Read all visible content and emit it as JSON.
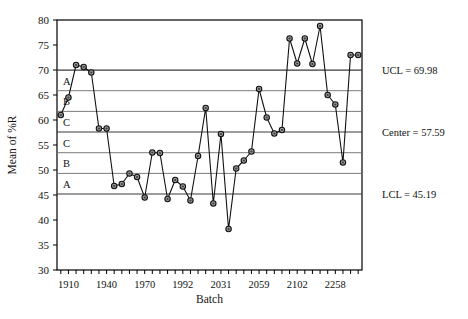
{
  "chart_data": {
    "type": "line",
    "title": "",
    "subtitle": "",
    "xlabel": "Batch",
    "ylabel": "Mean of %R",
    "xlim": [
      0,
      40
    ],
    "ylim": [
      30,
      80
    ],
    "grid": true,
    "legend_position": "none",
    "ytick_labels": [
      "30",
      "35",
      "40",
      "45",
      "50",
      "55",
      "60",
      "65",
      "70",
      "75",
      "80"
    ],
    "ytick_values": [
      30,
      35,
      40,
      45,
      50,
      55,
      60,
      65,
      70,
      75,
      80
    ],
    "xtick_labels": [
      "1910",
      "1940",
      "1970",
      "1992",
      "2031",
      "2059",
      "2102",
      "2258"
    ],
    "xtick_indices": [
      1,
      6,
      11,
      16,
      21,
      26,
      31,
      36
    ],
    "n_minor_ticks": 40,
    "x": [
      1,
      2,
      3,
      4,
      5,
      6,
      7,
      8,
      9,
      10,
      11,
      12,
      13,
      14,
      15,
      16,
      17,
      18,
      19,
      20,
      21,
      22,
      23,
      24,
      25,
      26,
      27,
      28,
      29,
      30,
      31,
      32,
      33,
      34,
      35,
      36,
      37,
      38,
      39,
      40
    ],
    "values": [
      61.0,
      64.5,
      71.0,
      70.6,
      69.5,
      58.3,
      58.3,
      46.8,
      47.2,
      49.3,
      48.6,
      44.5,
      53.5,
      53.4,
      44.2,
      48.0,
      46.7,
      43.9,
      52.8,
      62.4,
      43.3,
      57.2,
      38.2,
      50.3,
      51.9,
      53.7,
      66.2,
      60.5,
      57.3,
      58.0,
      76.3,
      71.3,
      76.3,
      71.2,
      78.8,
      65.0,
      63.1,
      51.5,
      73.0,
      73.0
    ],
    "control_limits": {
      "ucl": 69.98,
      "center": 57.59,
      "lcl": 45.19,
      "ucl_label": "UCL = 69.98",
      "center_label": "Center = 57.59",
      "lcl_label": "LCL = 45.19"
    },
    "zone_boundaries": [
      49.32,
      53.46,
      61.72,
      65.86
    ],
    "zone_labels_upper": [
      "A",
      "B",
      "C"
    ],
    "zone_labels_lower": [
      "C",
      "B",
      "A"
    ],
    "zone_label_values": [
      67.9,
      63.8,
      59.6,
      55.5,
      51.4,
      47.2
    ],
    "zone_label_text": [
      "A",
      "B",
      "C",
      "C",
      "B",
      "A"
    ],
    "colors": {
      "line": "#111111",
      "marker_fill": "#9a9a9a",
      "marker_edge": "#111111",
      "zone_line": "#6e6e6e",
      "limit_line": "#3a3a3a",
      "axis": "#000000",
      "background": "#ffffff"
    }
  }
}
